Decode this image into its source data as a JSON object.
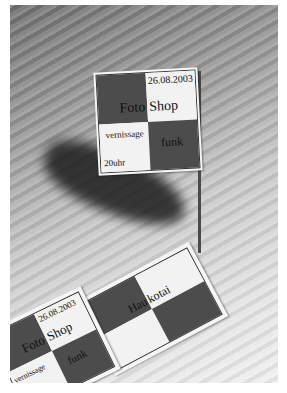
{
  "scene": {
    "description": "Grayscale photo of paper flag cards on a wooden table; one flag stands on a pole casting a shadow",
    "background_color": "#ffffff",
    "colors": {
      "dark_square": "#4c4c4c",
      "light_square": "#f2f2f2",
      "shadow": "#1c1c1c"
    }
  },
  "flag": {
    "date": "26.08.2003",
    "word_left": "Foto",
    "word_right": "Shop",
    "event": "vernissage",
    "time": "20uhr",
    "label_bottom_right": "funk"
  },
  "card_middle": {
    "word_left": "Hau",
    "word_right": "kotai"
  },
  "card_bottom_left": {
    "date": "26.08.2003",
    "word_left": "Foto",
    "word_right": "Shop",
    "event": "vernissage",
    "label_bottom_right": "funk"
  }
}
